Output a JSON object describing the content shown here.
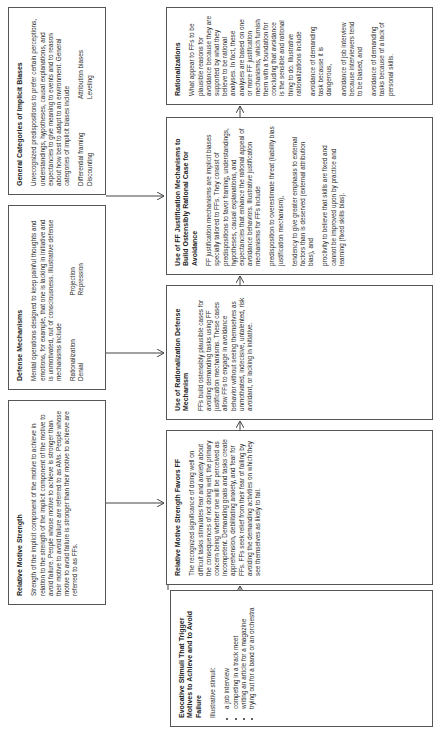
{
  "diagram": {
    "orientation": "rotated-90-ccw",
    "top_row": {
      "relative_motive_strength": {
        "title": "Relative Motive Strength",
        "body": "Strength of the implicit component of the motive to achieve in relation to the strength of the implicit component of the motive to avoid failure.  People whose motive to achieve is stronger than their motive to avoid failure are referred to as AMs.  People whose motive to avoid failure is stronger than their motive to achieve are referred to as FFs."
      },
      "defense_mechanisms": {
        "title": "Defense Mechanisms",
        "body": "Mental operations designed to keep painful thoughts and emotions, for example, that one is lacking in initiative and is unmotivated, out of consciousness. Illustrative defense mechanisms include",
        "col1": [
          "Rationalization",
          "Denial"
        ],
        "col2": [
          "Projection",
          "Repression"
        ]
      },
      "general_categories": {
        "title": "General Categories of Implicit Biases",
        "body": "Unrecognized predispositions to prefer certain perceptions, understandings, hypotheses, causal explanations, and expectancies to give meaning to events and to reason about how best to adapt to an environment.  General categories of implicit biases include",
        "col1": [
          "Differential framing",
          "Discounting"
        ],
        "col2": [
          "Attribution biases",
          "Leveling"
        ]
      }
    },
    "bottom_row": {
      "evocative_stimuli": {
        "title": "Evocative Stimuli That Trigger Motives to Achieve and to Avoid Failure",
        "intro": "Illustrative stimuli:",
        "items": [
          "a job interview",
          "competing in a track meet",
          "writing an article for a magazine",
          "trying out for a band or an orchestra"
        ]
      },
      "relative_favors_ff": {
        "title": "Relative Motive Strength Favors FF",
        "body": "The recognized significance of doing well on difficult tasks stimulates fear and anxiety about the consequences of not doing well, the primary concern being whether one will be perceived as incompetent. Demanding goals and tasks create apprehension, debilitating anxiety, and fear for FFs.  FFs seek relief from their fear of failing by avoiding the demanding activities on which they see themselves as likely to fail."
      },
      "use_of_rationalization": {
        "title": "Use of Rationalization Defense Mechanism",
        "body": "FFs build ostensibly plausible cases for avoiding demanding tasks using FF justification mechanisms. These cases allow FFs to engage in avoidance behavior without seeing themselves as unmotivated, indecisive, untalented, risk avoidant, or lacking in initiative."
      },
      "ff_justification": {
        "title": "Use of FF Justification Mechanisms to Build Ostensibly Rational Case for Avoidance",
        "body": "FF justification mechanisms are implicit biases specially tailored to FFs. They consist of predispositions to favor framing, understandings, hypotheses, causal explanations, and expectancies that enhance the rational appeal of avoidance behaviors. Illustrative justification mechanisms for FFs include",
        "items": [
          "predisposition to overestimate threat (liability bias justification mechanism),",
          "tendency to give greater emphasis to external factors than is deserved (external attribution bias), and",
          "proclivity to believe that skills are fixed and cannot be improved upon by practice and learning (fixed skills bias)."
        ]
      },
      "rationalizations": {
        "title": "Rationalizations",
        "body": "What appear to FFs to be plausible reasons for avoidance because they are supported by what they believe to be rational analyses.  In fact, these analyses are based on one or more FF justification mechanisms, which furnish them with a foundation for concluding that avoidance is the sensible and rational thing to do.  Illustrative rationalizations include",
        "items": [
          "avoidance of demanding task because it is dangerous,",
          "avoidance of job interview because interviewers tend to be biased, and",
          "avoidance of demanding tasks because of a lack of personal skills."
        ]
      }
    },
    "colors": {
      "border": "#555555",
      "text": "#2a2a2a",
      "background": "#ffffff"
    }
  }
}
